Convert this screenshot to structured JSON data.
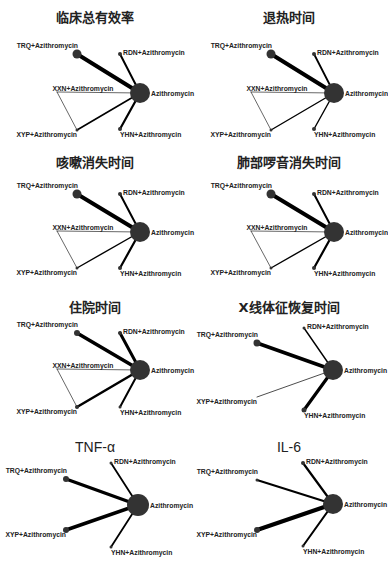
{
  "figure": {
    "node_labels": {
      "AZ": "Azithromycin",
      "TRQ": "TRQ+Azithromycin",
      "RDN": "RDN+Azithromycin",
      "XXN": "XXN+Azithromycin",
      "XYP": "XYP+Azithromycin",
      "YHN": "YHN+Azithromycin"
    },
    "colors": {
      "node": "#333333",
      "edge": "#000000",
      "title": "#222222"
    },
    "panels": [
      {
        "id": "clinical-efficacy",
        "title": "临床总有效率",
        "latin": false,
        "x": 0,
        "y": 0,
        "nodes": [
          {
            "key": "AZ",
            "cx": 140,
            "cy": 93,
            "r": 10
          },
          {
            "key": "TRQ",
            "cx": 77,
            "cy": 54,
            "r": 4.5
          },
          {
            "key": "RDN",
            "cx": 120,
            "cy": 54,
            "r": 2
          },
          {
            "key": "XXN",
            "cx": 57,
            "cy": 92,
            "r": 0
          },
          {
            "key": "XYP",
            "cx": 77,
            "cy": 130,
            "r": 1.5
          },
          {
            "key": "YHN",
            "cx": 120,
            "cy": 129,
            "r": 2
          }
        ],
        "edges": [
          {
            "a": "AZ",
            "b": "TRQ",
            "w": 4
          },
          {
            "a": "AZ",
            "b": "RDN",
            "w": 2
          },
          {
            "a": "AZ",
            "b": "XXN",
            "w": 0.6
          },
          {
            "a": "AZ",
            "b": "XYP",
            "w": 1.6
          },
          {
            "a": "AZ",
            "b": "YHN",
            "w": 2.2
          },
          {
            "a": "XXN",
            "b": "XYP",
            "w": 0.6
          }
        ]
      },
      {
        "id": "fever-time",
        "title": "退热时间",
        "latin": false,
        "x": 194,
        "y": 0,
        "nodes": [
          {
            "key": "AZ",
            "cx": 140,
            "cy": 93,
            "r": 10
          },
          {
            "key": "TRQ",
            "cx": 77,
            "cy": 54,
            "r": 4.5
          },
          {
            "key": "RDN",
            "cx": 120,
            "cy": 54,
            "r": 2
          },
          {
            "key": "XXN",
            "cx": 57,
            "cy": 92,
            "r": 0
          },
          {
            "key": "XYP",
            "cx": 77,
            "cy": 130,
            "r": 1.5
          },
          {
            "key": "YHN",
            "cx": 120,
            "cy": 129,
            "r": 2
          }
        ],
        "edges": [
          {
            "a": "AZ",
            "b": "TRQ",
            "w": 4
          },
          {
            "a": "AZ",
            "b": "RDN",
            "w": 1.8
          },
          {
            "a": "AZ",
            "b": "XXN",
            "w": 0.6
          },
          {
            "a": "AZ",
            "b": "XYP",
            "w": 1.4
          },
          {
            "a": "AZ",
            "b": "YHN",
            "w": 1.4
          },
          {
            "a": "XXN",
            "b": "XYP",
            "w": 0.6
          }
        ]
      },
      {
        "id": "cough-time",
        "title": "咳嗽消失时间",
        "latin": false,
        "x": 0,
        "y": 145,
        "nodes": [
          {
            "key": "AZ",
            "cx": 140,
            "cy": 87,
            "r": 10
          },
          {
            "key": "TRQ",
            "cx": 77,
            "cy": 49,
            "r": 4.5
          },
          {
            "key": "RDN",
            "cx": 120,
            "cy": 49,
            "r": 2
          },
          {
            "key": "XXN",
            "cx": 57,
            "cy": 86,
            "r": 0
          },
          {
            "key": "XYP",
            "cx": 77,
            "cy": 123,
            "r": 1.5
          },
          {
            "key": "YHN",
            "cx": 120,
            "cy": 123,
            "r": 2
          }
        ],
        "edges": [
          {
            "a": "AZ",
            "b": "TRQ",
            "w": 4
          },
          {
            "a": "AZ",
            "b": "RDN",
            "w": 2
          },
          {
            "a": "AZ",
            "b": "XXN",
            "w": 0.6
          },
          {
            "a": "AZ",
            "b": "XYP",
            "w": 1.4
          },
          {
            "a": "AZ",
            "b": "YHN",
            "w": 2.2
          },
          {
            "a": "XXN",
            "b": "XYP",
            "w": 0.6
          }
        ]
      },
      {
        "id": "lung-rales-time",
        "title": "肺部啰音消失时间",
        "latin": false,
        "x": 194,
        "y": 145,
        "nodes": [
          {
            "key": "AZ",
            "cx": 140,
            "cy": 87,
            "r": 10
          },
          {
            "key": "TRQ",
            "cx": 77,
            "cy": 49,
            "r": 4.5
          },
          {
            "key": "RDN",
            "cx": 120,
            "cy": 49,
            "r": 2
          },
          {
            "key": "XXN",
            "cx": 57,
            "cy": 86,
            "r": 0
          },
          {
            "key": "XYP",
            "cx": 77,
            "cy": 123,
            "r": 1.5
          },
          {
            "key": "YHN",
            "cx": 120,
            "cy": 123,
            "r": 2
          }
        ],
        "edges": [
          {
            "a": "AZ",
            "b": "TRQ",
            "w": 4
          },
          {
            "a": "AZ",
            "b": "RDN",
            "w": 2
          },
          {
            "a": "AZ",
            "b": "XXN",
            "w": 0.6
          },
          {
            "a": "AZ",
            "b": "XYP",
            "w": 1.4
          },
          {
            "a": "AZ",
            "b": "YHN",
            "w": 2.2
          },
          {
            "a": "XXN",
            "b": "XYP",
            "w": 0.6
          }
        ]
      },
      {
        "id": "hospital-stay",
        "title": "住院时间",
        "latin": false,
        "x": 0,
        "y": 290,
        "nodes": [
          {
            "key": "AZ",
            "cx": 140,
            "cy": 80,
            "r": 10
          },
          {
            "key": "TRQ",
            "cx": 77,
            "cy": 43,
            "r": 3
          },
          {
            "key": "RDN",
            "cx": 120,
            "cy": 43,
            "r": 2
          },
          {
            "key": "XXN",
            "cx": 57,
            "cy": 79,
            "r": 0
          },
          {
            "key": "XYP",
            "cx": 77,
            "cy": 117,
            "r": 2
          },
          {
            "key": "YHN",
            "cx": 120,
            "cy": 117,
            "r": 1.5
          }
        ],
        "edges": [
          {
            "a": "AZ",
            "b": "TRQ",
            "w": 3.6
          },
          {
            "a": "AZ",
            "b": "RDN",
            "w": 3
          },
          {
            "a": "AZ",
            "b": "XXN",
            "w": 0.6
          },
          {
            "a": "AZ",
            "b": "XYP",
            "w": 2.6
          },
          {
            "a": "AZ",
            "b": "YHN",
            "w": 2
          },
          {
            "a": "XXN",
            "b": "XYP",
            "w": 0.6
          }
        ]
      },
      {
        "id": "xray-recovery",
        "title": "X线体征恢复时间",
        "latin": false,
        "x": 194,
        "y": 290,
        "nodes": [
          {
            "key": "AZ",
            "cx": 139,
            "cy": 80,
            "r": 10
          },
          {
            "key": "TRQ",
            "cx": 63,
            "cy": 53,
            "r": 3.5
          },
          {
            "key": "RDN",
            "cx": 110,
            "cy": 38,
            "r": 1.5
          },
          {
            "key": "XYP",
            "cx": 63,
            "cy": 107,
            "r": 0
          },
          {
            "key": "YHN",
            "cx": 110,
            "cy": 120,
            "r": 2.5
          }
        ],
        "edges": [
          {
            "a": "AZ",
            "b": "TRQ",
            "w": 3.6
          },
          {
            "a": "AZ",
            "b": "RDN",
            "w": 1.4
          },
          {
            "a": "AZ",
            "b": "XYP",
            "w": 0.7
          },
          {
            "a": "AZ",
            "b": "YHN",
            "w": 3.2
          }
        ]
      },
      {
        "id": "tnf-alpha",
        "title": "TNF-α",
        "latin": true,
        "x": 0,
        "y": 430,
        "nodes": [
          {
            "key": "AZ",
            "cx": 138,
            "cy": 75,
            "r": 11
          },
          {
            "key": "TRQ",
            "cx": 66,
            "cy": 49,
            "r": 3
          },
          {
            "key": "RDN",
            "cx": 111,
            "cy": 33,
            "r": 1.5
          },
          {
            "key": "XYP",
            "cx": 66,
            "cy": 100,
            "r": 3
          },
          {
            "key": "YHN",
            "cx": 111,
            "cy": 117,
            "r": 1.5
          }
        ],
        "edges": [
          {
            "a": "AZ",
            "b": "TRQ",
            "w": 3.4
          },
          {
            "a": "AZ",
            "b": "RDN",
            "w": 1.8
          },
          {
            "a": "AZ",
            "b": "XYP",
            "w": 3.6
          },
          {
            "a": "AZ",
            "b": "YHN",
            "w": 1.8
          }
        ]
      },
      {
        "id": "il-6",
        "title": "IL-6",
        "latin": true,
        "x": 194,
        "y": 430,
        "nodes": [
          {
            "key": "AZ",
            "cx": 139,
            "cy": 74,
            "r": 10
          },
          {
            "key": "TRQ",
            "cx": 63,
            "cy": 50,
            "r": 1.5
          },
          {
            "key": "RDN",
            "cx": 109,
            "cy": 33,
            "r": 2
          },
          {
            "key": "XYP",
            "cx": 63,
            "cy": 100,
            "r": 3
          },
          {
            "key": "YHN",
            "cx": 109,
            "cy": 116,
            "r": 1.5
          }
        ],
        "edges": [
          {
            "a": "AZ",
            "b": "TRQ",
            "w": 2
          },
          {
            "a": "AZ",
            "b": "RDN",
            "w": 2.2
          },
          {
            "a": "AZ",
            "b": "XYP",
            "w": 4.2
          },
          {
            "a": "AZ",
            "b": "YHN",
            "w": 2
          }
        ]
      }
    ]
  }
}
